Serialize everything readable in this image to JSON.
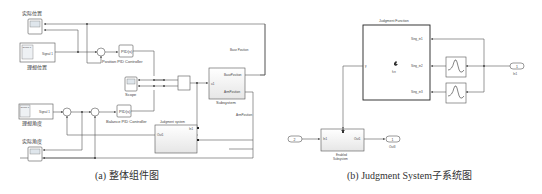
{
  "panel_a": {
    "caption": "(a) 整体组件图",
    "blocks": {
      "scope_actual_pos": {
        "label": "实际位置"
      },
      "signal_pos": {
        "inner_label": "Group 1",
        "port": "Signal 1",
        "label": "理想位置"
      },
      "pid_position": {
        "text": "PID(s)",
        "label": "Position PID Controller"
      },
      "scope_mid": {
        "label": "Scope"
      },
      "subsystem": {
        "port_in": "u1",
        "port_base": "BasePosition",
        "port_arm": "ArmPosition",
        "label": "Subsystem"
      },
      "signal_angle": {
        "inner_label": "Group 1",
        "port": "Signal 1",
        "label": "理想角度"
      },
      "pid_balance": {
        "text": "PID(s)",
        "label": "Balance PID Controller"
      },
      "judgment_system": {
        "title": "Judgment system",
        "port_out": "Out1",
        "port_in": "In1"
      },
      "scope_actual_angle": {
        "label": "实际角度"
      }
    },
    "wire_labels": {
      "base": "Base Position",
      "arm": "ArmPosition"
    }
  },
  "panel_b": {
    "caption": "(b) Judgment System子系统图",
    "blocks": {
      "judgment_function": {
        "title": "Judgment Function",
        "port_y": "y",
        "ports": [
          "Sing_in1",
          "Sing_in2",
          "Sing_in3"
        ],
        "icon_label": "fcn"
      },
      "inport1": {
        "number": "1",
        "label": "In1"
      },
      "inport2": {
        "number": "2"
      },
      "enabled_subsystem": {
        "port_in": "In1",
        "port_out": "Out1",
        "label1": "Enabled",
        "label2": "Subsystem"
      },
      "outport1": {
        "number": "1",
        "label": "Out3"
      }
    }
  }
}
